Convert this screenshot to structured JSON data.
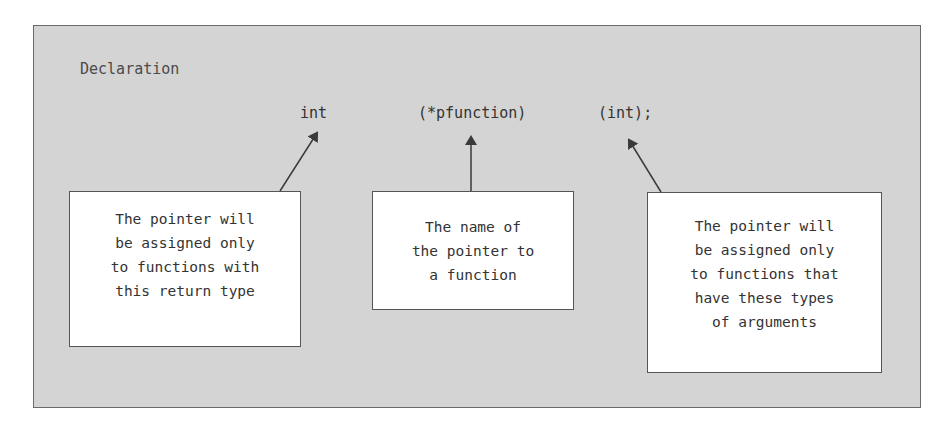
{
  "diagram": {
    "title": "Declaration",
    "declaration_parts": [
      {
        "id": "return-type",
        "text": "int"
      },
      {
        "id": "pointer-name",
        "text": "(*pfunction)"
      },
      {
        "id": "arg-types",
        "text": "(int);"
      }
    ],
    "callouts": [
      {
        "target": "return-type",
        "lines": [
          "The pointer will",
          "be assigned only",
          "to functions with",
          "this return type"
        ]
      },
      {
        "target": "pointer-name",
        "lines": [
          "The name of",
          "the pointer to",
          "a function"
        ]
      },
      {
        "target": "arg-types",
        "lines": [
          "The pointer will",
          "be assigned only",
          "to functions that",
          "have these types",
          "of arguments"
        ]
      }
    ],
    "colors": {
      "panel_bg": "#d4d4d4",
      "box_bg": "#ffffff",
      "border": "#555555",
      "text": "#333333"
    }
  }
}
